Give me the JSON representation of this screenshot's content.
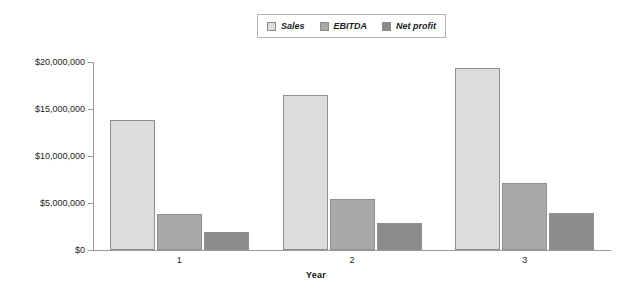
{
  "chart_data": {
    "type": "bar",
    "title": "",
    "subtitle": "",
    "xlabel": "Year",
    "ylabel": "",
    "categories": [
      "1",
      "2",
      "3"
    ],
    "series": [
      {
        "name": "Sales",
        "values": [
          13800000,
          16500000,
          19400000
        ],
        "color": "#dcdcda"
      },
      {
        "name": "EBITDA",
        "values": [
          3800000,
          5400000,
          7100000
        ],
        "color": "#a9a9a7"
      },
      {
        "name": "Net profit",
        "values": [
          1900000,
          2900000,
          3900000
        ],
        "color": "#8c8c8a"
      }
    ],
    "ylim": [
      0,
      20000000
    ],
    "ytick_values": [
      0,
      5000000,
      10000000,
      15000000,
      20000000
    ],
    "ytick_labels": [
      "$0",
      "$5,000,000",
      "$10,000,000",
      "$15,000,000",
      "$20,000,000"
    ],
    "grid": false,
    "legend_position": "top-center",
    "legend_entries": [
      "Sales",
      "EBITDA",
      "Net profit"
    ],
    "annotations": []
  },
  "legend": {
    "items": [
      {
        "label": "Sales",
        "swatch_name": "legend-swatch-sales"
      },
      {
        "label": "EBITDA",
        "swatch_name": "legend-swatch-ebitda"
      },
      {
        "label": "Net profit",
        "swatch_name": "legend-swatch-netprofit"
      }
    ]
  },
  "axes": {
    "x_title": "Year",
    "x_categories": [
      "1",
      "2",
      "3"
    ],
    "y_labels": [
      "$20,000,000",
      "$15,000,000",
      "$10,000,000",
      "$5,000,000",
      "$0"
    ]
  }
}
